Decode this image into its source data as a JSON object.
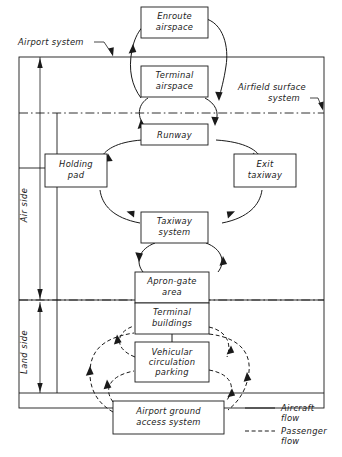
{
  "diagram": {
    "colors": {
      "ink": "#1a1a1a",
      "paper": "#ffffff"
    },
    "boxes": [
      {
        "id": "enroute_airspace",
        "lines": [
          "Enroute",
          "airspace"
        ]
      },
      {
        "id": "terminal_airspace",
        "lines": [
          "Terminal",
          "airspace"
        ]
      },
      {
        "id": "runway",
        "lines": [
          "Runway"
        ]
      },
      {
        "id": "holding_pad",
        "lines": [
          "Holding",
          "pad"
        ]
      },
      {
        "id": "exit_taxiway",
        "lines": [
          "Exit",
          "taxiway"
        ]
      },
      {
        "id": "taxiway_system",
        "lines": [
          "Taxiway",
          "system"
        ]
      },
      {
        "id": "apron_gate_area",
        "lines": [
          "Apron-gate",
          "area"
        ]
      },
      {
        "id": "terminal_buildings",
        "lines": [
          "Terminal",
          "buildings"
        ]
      },
      {
        "id": "vehicular_circulation_parking",
        "lines": [
          "Vehicular",
          "circulation",
          "parking"
        ]
      },
      {
        "id": "airport_ground_access_system",
        "lines": [
          "Airport ground",
          "access system"
        ]
      }
    ],
    "annotations": [
      {
        "id": "airport_system",
        "lines": [
          "Airport system"
        ]
      },
      {
        "id": "airfield_surface_system",
        "lines": [
          "Airfield surface",
          "system"
        ]
      }
    ],
    "side_labels": [
      {
        "id": "air_side",
        "text": "Air side"
      },
      {
        "id": "land_side",
        "text": "Land side"
      }
    ],
    "legend": [
      {
        "id": "aircraft_flow",
        "style": "solid",
        "lines": [
          "Aircraft",
          "flow"
        ]
      },
      {
        "id": "passenger_flow",
        "style": "dashed",
        "lines": [
          "Passenger",
          "flow"
        ]
      }
    ]
  }
}
